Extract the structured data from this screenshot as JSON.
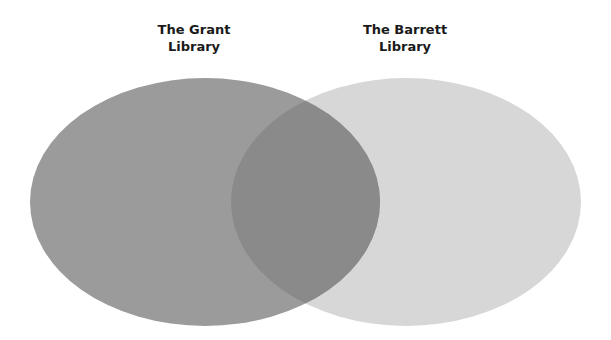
{
  "diagram": {
    "type": "venn",
    "sets": [
      {
        "id": "grant",
        "label_line1": "The Grant",
        "label_line2": "Library",
        "color": "#9b9b9b",
        "cx": 205,
        "cy": 202,
        "rx": 175,
        "ry": 124
      },
      {
        "id": "barrett",
        "label_line1": "The Barrett",
        "label_line2": "Library",
        "color": "#d7d7d7",
        "cx": 406,
        "cy": 202,
        "rx": 175,
        "ry": 124
      }
    ],
    "overlap_color": "#8a8a8a"
  }
}
